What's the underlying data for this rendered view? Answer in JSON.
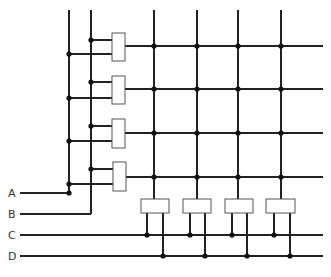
{
  "diagram": {
    "title": "",
    "colors": {
      "wire": "#222222",
      "gate_fill": "#ffffff",
      "gate_stroke": "#555555",
      "dot": "#111111",
      "label": "#333333"
    },
    "inputs": [
      {
        "label": "A",
        "y": 193
      },
      {
        "label": "B",
        "y": 214
      },
      {
        "label": "C",
        "y": 235
      },
      {
        "label": "D",
        "y": 256
      }
    ],
    "input_line_start_x": 20,
    "vertical_buses": [
      {
        "input": "A",
        "x": 69,
        "top": 10,
        "bottom": 193
      },
      {
        "input": "B",
        "x": 91,
        "top": 10,
        "bottom": 214
      }
    ],
    "row_gates": [
      {
        "x": 112,
        "y": 33,
        "w": 13,
        "h": 28,
        "b_tap_y": 40,
        "a_tap_y": 54,
        "output_y": 46
      },
      {
        "x": 112,
        "y": 76,
        "w": 13,
        "h": 28,
        "b_tap_y": 82,
        "a_tap_y": 98,
        "output_y": 89
      },
      {
        "x": 112,
        "y": 119,
        "w": 13,
        "h": 29,
        "b_tap_y": 126,
        "a_tap_y": 141,
        "output_y": 133
      },
      {
        "x": 113,
        "y": 162,
        "w": 13,
        "h": 29,
        "b_tap_y": 169,
        "a_tap_y": 184,
        "output_y": 177
      }
    ],
    "grid_columns_x": [
      154,
      197,
      238,
      281
    ],
    "grid_top_y": 10,
    "row_line_end_x": 323,
    "column_gates": [
      {
        "x": 141,
        "y": 199,
        "w": 28,
        "h": 14,
        "col_x": 154,
        "c_leg_x": 147,
        "d_leg_x": 163
      },
      {
        "x": 183,
        "y": 199,
        "w": 28,
        "h": 14,
        "col_x": 197,
        "c_leg_x": 190,
        "d_leg_x": 205
      },
      {
        "x": 225,
        "y": 199,
        "w": 28,
        "h": 14,
        "col_x": 238,
        "c_leg_x": 232,
        "d_leg_x": 247
      },
      {
        "x": 266,
        "y": 199,
        "w": 29,
        "h": 14,
        "col_x": 281,
        "c_leg_x": 274,
        "d_leg_x": 290
      }
    ],
    "bottom_line_end_x": 323
  }
}
